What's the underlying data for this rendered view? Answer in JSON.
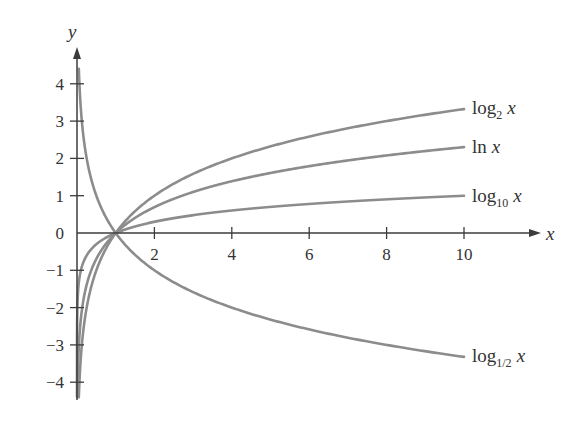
{
  "chart_data": {
    "type": "line",
    "title": "",
    "xlabel": "x",
    "ylabel": "y",
    "xlim": [
      0,
      12
    ],
    "ylim": [
      -4.5,
      5
    ],
    "grid": false,
    "legend_position": "inline-right",
    "x_ticks": [
      2,
      4,
      6,
      8,
      10
    ],
    "y_ticks": [
      -4,
      -3,
      -2,
      -1,
      0,
      1,
      2,
      3,
      4
    ],
    "x_tick_labels": [
      "2",
      "4",
      "6",
      "8",
      "10"
    ],
    "y_tick_labels": [
      "−4",
      "−3",
      "−2",
      "−1",
      "0",
      "1",
      "2",
      "3",
      "4"
    ],
    "series": [
      {
        "name": "log_2 x",
        "label_main": "log",
        "label_sub": "2",
        "label_var": "x",
        "base": 2,
        "x": [
          0.0625,
          0.25,
          0.5,
          1,
          2,
          4,
          6,
          8,
          10
        ],
        "values": [
          -4,
          -2,
          -1,
          0,
          1,
          2,
          2.58,
          3,
          3.32
        ]
      },
      {
        "name": "ln x",
        "label_main": "ln",
        "label_sub": "",
        "label_var": "x",
        "base": 2.718281828,
        "x": [
          0.018,
          0.135,
          0.368,
          1,
          2,
          4,
          6,
          8,
          10
        ],
        "values": [
          -4,
          -2,
          -1,
          0,
          0.69,
          1.39,
          1.79,
          2.08,
          2.3
        ]
      },
      {
        "name": "log_10 x",
        "label_main": "log",
        "label_sub": "10",
        "label_var": "x",
        "base": 10,
        "x": [
          0.0001,
          0.01,
          0.1,
          1,
          2,
          4,
          6,
          8,
          10
        ],
        "values": [
          -4,
          -2,
          -1,
          0,
          0.3,
          0.6,
          0.78,
          0.9,
          1.0
        ]
      },
      {
        "name": "log_1/2 x",
        "label_main": "log",
        "label_sub": "1/2",
        "label_var": "x",
        "base": 0.5,
        "x": [
          0.0625,
          0.25,
          0.5,
          1,
          2,
          4,
          6,
          8,
          10
        ],
        "values": [
          4,
          2,
          1,
          0,
          -1,
          -2,
          -2.58,
          -3,
          -3.32
        ]
      }
    ],
    "annotations": [
      "log_2 x",
      "ln x",
      "log_10 x",
      "log_1/2 x"
    ]
  },
  "colors": {
    "curve": "#8c8c8c",
    "axis": "#3c3c3c",
    "text": "#333333"
  }
}
